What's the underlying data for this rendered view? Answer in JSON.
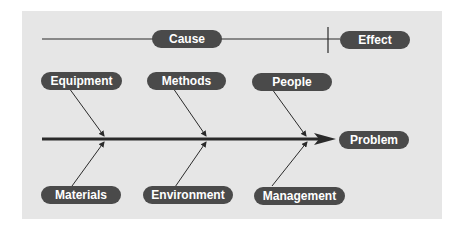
{
  "diagram": {
    "type": "fishbone",
    "title_row": {
      "cause_label": "Cause",
      "effect_label": "Effect"
    },
    "problem_label": "Problem",
    "categories_top": [
      {
        "label": "Equipment"
      },
      {
        "label": "Methods"
      },
      {
        "label": "People"
      }
    ],
    "categories_bottom": [
      {
        "label": "Materials"
      },
      {
        "label": "Environment"
      },
      {
        "label": "Management"
      }
    ],
    "colors": {
      "panel_background": "#e6e6e6",
      "pill_fill": "#4a4a4a",
      "pill_text": "#ffffff",
      "line": "#2a2a2a"
    }
  }
}
